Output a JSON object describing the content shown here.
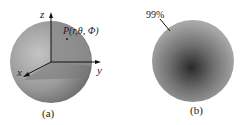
{
  "figure_a": {
    "caption": "(a)",
    "point_label": "P(r,θ, Φ)",
    "axes": {
      "x": "x",
      "y": "y",
      "z": "z"
    }
  },
  "figure_b": {
    "caption": "(b)",
    "annotation": "99%"
  }
}
